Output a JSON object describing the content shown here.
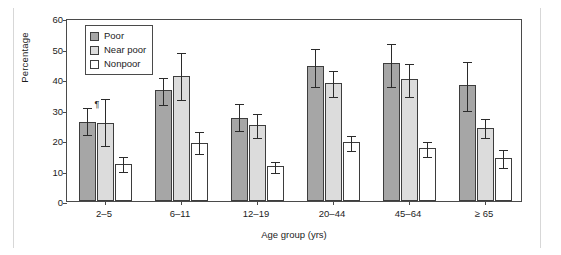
{
  "chart_data": {
    "type": "bar",
    "title": "",
    "xlabel": "Age group (yrs)",
    "ylabel": "Percentage",
    "categories": [
      "2–5",
      "6–11",
      "12–19",
      "20–44",
      "45–64",
      "≥ 65"
    ],
    "ylim": [
      0,
      60
    ],
    "yticks": [
      0,
      10,
      20,
      30,
      40,
      50,
      60
    ],
    "ytick_labels": [
      "0",
      "10",
      "20",
      "30",
      "40",
      "50",
      "60"
    ],
    "grid": false,
    "legend_position": "top-left",
    "error_bars": "95% confidence interval",
    "series": [
      {
        "name": "Poor",
        "color": "#a6a6a6",
        "values": [
          26.0,
          36.3,
          27.2,
          44.2,
          45.1,
          38.1
        ],
        "ci_low": [
          21.9,
          31.7,
          23.2,
          37.7,
          37.6,
          29.9
        ],
        "ci_high": [
          31.2,
          41.0,
          32.3,
          50.4,
          52.0,
          46.1
        ]
      },
      {
        "name": "Near poor",
        "color": "#dcdcdc",
        "values": [
          25.5,
          41.0,
          24.9,
          38.6,
          40.0,
          24.1
        ],
        "ci_low": [
          18.4,
          33.4,
          21.0,
          34.3,
          34.4,
          21.0
        ],
        "ci_high": [
          34.0,
          49.1,
          29.2,
          43.2,
          45.5,
          27.5
        ]
      },
      {
        "name": "Nonpoor",
        "color": "#ffffff",
        "values": [
          12.2,
          19.0,
          11.4,
          19.4,
          17.3,
          14.2
        ],
        "ci_low": [
          9.7,
          15.6,
          9.6,
          16.8,
          14.6,
          11.2
        ],
        "ci_high": [
          15.1,
          23.2,
          13.6,
          22.0,
          20.1,
          17.4
        ]
      }
    ],
    "annotations": [
      {
        "text": "¶",
        "series": "Poor",
        "category": "2–5"
      }
    ]
  },
  "legend": {
    "items": [
      {
        "label": "Poor",
        "swatch": "poor"
      },
      {
        "label": "Near poor",
        "swatch": "near-poor"
      },
      {
        "label": "Nonpoor",
        "swatch": "nonpoor"
      }
    ]
  }
}
